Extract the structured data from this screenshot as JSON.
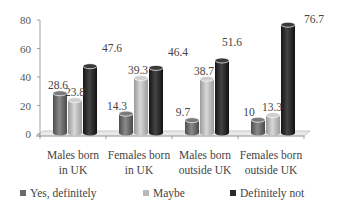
{
  "chart_data": {
    "type": "bar",
    "style": "3d-cylinder",
    "title": "",
    "xlabel": "",
    "ylabel": "",
    "ylim": [
      0,
      80
    ],
    "yticks": [
      0,
      20,
      40,
      60,
      80
    ],
    "grid": false,
    "legend_position": "bottom",
    "categories": [
      "Males born in UK",
      "Females born in UK",
      "Males born outside UK",
      "Females born outside UK"
    ],
    "category_lines": [
      [
        "Males born",
        "in UK"
      ],
      [
        "Females born",
        "in UK"
      ],
      [
        "Males born",
        "outside UK"
      ],
      [
        "Females born",
        "outside UK"
      ]
    ],
    "series": [
      {
        "name": "Yes, definitely",
        "color": "#6b6b6b",
        "values": [
          28.6,
          14.3,
          9.7,
          10
        ]
      },
      {
        "name": "Maybe",
        "color": "#b9b9b9",
        "values": [
          23.8,
          39.3,
          38.7,
          13.3
        ]
      },
      {
        "name": "Definitely not",
        "color": "#2a2a2a",
        "values": [
          47.6,
          46.4,
          51.6,
          76.7
        ]
      }
    ],
    "data_labels": [
      [
        "28.6",
        "14.3",
        "9.7",
        "10"
      ],
      [
        "23.8",
        "39.3",
        "38.7",
        "13.3"
      ],
      [
        "47.6",
        "46.4",
        "51.6",
        "76.7"
      ]
    ]
  },
  "legend": {
    "items": [
      {
        "label": "Yes, definitely",
        "color": "#6b6b6b"
      },
      {
        "label": "Maybe",
        "color": "#b9b9b9"
      },
      {
        "label": "Definitely not",
        "color": "#2a2a2a"
      }
    ]
  }
}
